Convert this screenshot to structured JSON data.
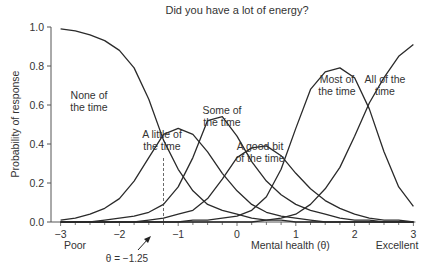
{
  "chart_data": {
    "type": "line",
    "title": "Did you have a lot of energy?",
    "xlabel": "Mental health (θ)",
    "ylabel": "Probability of response",
    "xlim": [
      -3,
      3
    ],
    "ylim": [
      0,
      1.0
    ],
    "xticks": [
      "-3",
      "-2",
      "-1",
      "0",
      "1",
      "2",
      "3"
    ],
    "yticks": [
      "0.0",
      "0.2",
      "0.4",
      "0.6",
      "0.8",
      "1.0"
    ],
    "grid": false,
    "legend": "inline labels",
    "x_end_labels": {
      "left": "Poor",
      "right": "Excellent"
    },
    "annotation": {
      "text": "θ = −1.25",
      "x": -1.25
    },
    "x": [
      -3.0,
      -2.75,
      -2.5,
      -2.25,
      -2.0,
      -1.75,
      -1.5,
      -1.25,
      -1.0,
      -0.75,
      -0.5,
      -0.25,
      0.0,
      0.25,
      0.5,
      0.75,
      1.0,
      1.25,
      1.5,
      1.75,
      2.0,
      2.25,
      2.5,
      2.75,
      3.0
    ],
    "series": [
      {
        "name": "None of the time",
        "label_lines": [
          "None of",
          "the time"
        ],
        "values": [
          0.99,
          0.98,
          0.96,
          0.93,
          0.88,
          0.79,
          0.63,
          0.42,
          0.27,
          0.16,
          0.09,
          0.06,
          0.04,
          0.02,
          0.01,
          0.01,
          0.0,
          0.0,
          0.0,
          0.0,
          0.0,
          0.0,
          0.0,
          0.0,
          0.0
        ]
      },
      {
        "name": "A little of the time",
        "label_lines": [
          "A little of",
          "the time"
        ],
        "values": [
          0.01,
          0.02,
          0.04,
          0.07,
          0.12,
          0.21,
          0.33,
          0.45,
          0.48,
          0.45,
          0.36,
          0.25,
          0.16,
          0.09,
          0.05,
          0.03,
          0.02,
          0.01,
          0.0,
          0.0,
          0.0,
          0.0,
          0.0,
          0.0,
          0.0
        ]
      },
      {
        "name": "Some of the time",
        "label_lines": [
          "Some of",
          "the time"
        ],
        "values": [
          0.0,
          0.0,
          0.0,
          0.01,
          0.02,
          0.03,
          0.05,
          0.09,
          0.18,
          0.33,
          0.52,
          0.54,
          0.44,
          0.31,
          0.21,
          0.14,
          0.09,
          0.06,
          0.04,
          0.02,
          0.01,
          0.01,
          0.0,
          0.0,
          0.0
        ]
      },
      {
        "name": "A good bit of the time",
        "label_lines": [
          "A good bit",
          "of the time"
        ],
        "values": [
          0.0,
          0.0,
          0.0,
          0.0,
          0.0,
          0.0,
          0.01,
          0.02,
          0.04,
          0.06,
          0.12,
          0.22,
          0.33,
          0.38,
          0.39,
          0.34,
          0.25,
          0.17,
          0.11,
          0.07,
          0.04,
          0.02,
          0.01,
          0.01,
          0.0
        ]
      },
      {
        "name": "Most of the time",
        "label_lines": [
          "Most of",
          "the time"
        ],
        "values": [
          0.0,
          0.0,
          0.0,
          0.0,
          0.0,
          0.0,
          0.0,
          0.0,
          0.0,
          0.01,
          0.01,
          0.02,
          0.03,
          0.06,
          0.13,
          0.27,
          0.48,
          0.68,
          0.77,
          0.79,
          0.74,
          0.58,
          0.36,
          0.18,
          0.08
        ]
      },
      {
        "name": "All of the time",
        "label_lines": [
          "All of the",
          "time"
        ],
        "values": [
          0.0,
          0.0,
          0.0,
          0.0,
          0.0,
          0.0,
          0.0,
          0.0,
          0.0,
          0.0,
          0.0,
          0.0,
          0.0,
          0.0,
          0.01,
          0.02,
          0.04,
          0.09,
          0.17,
          0.28,
          0.44,
          0.61,
          0.74,
          0.85,
          0.91
        ]
      }
    ]
  }
}
